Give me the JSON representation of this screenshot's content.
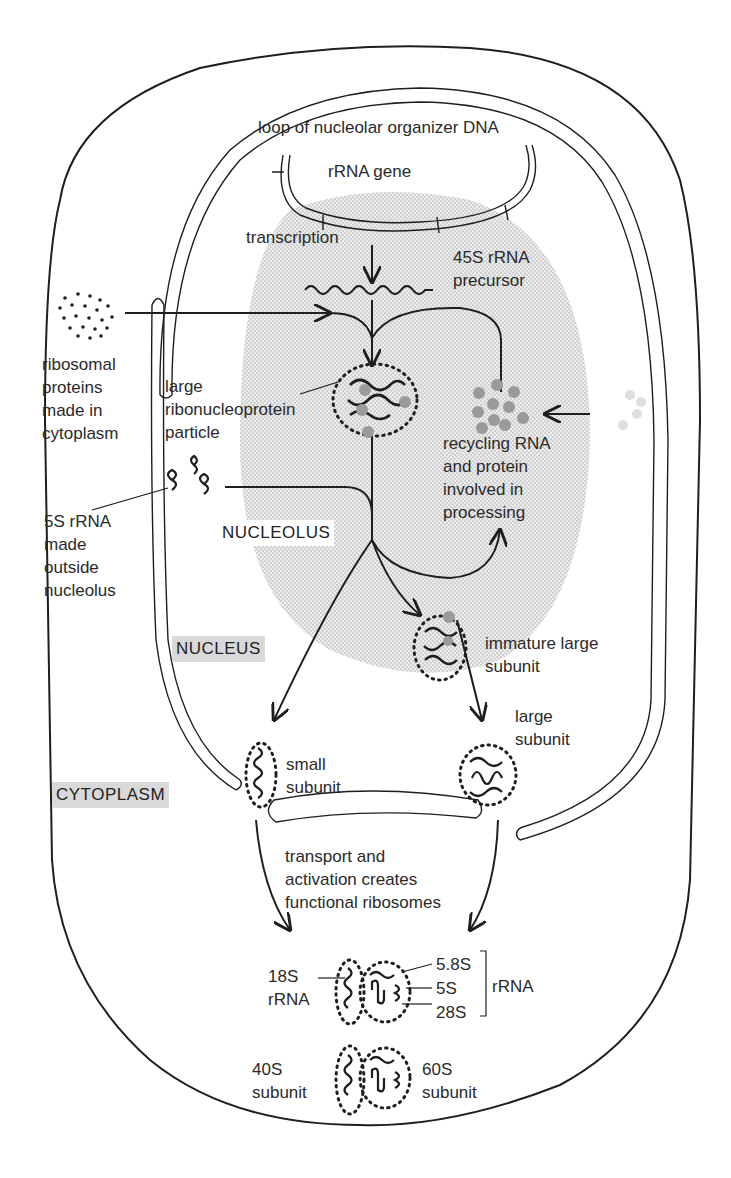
{
  "diagram": {
    "title_context": "Ribosome assembly: nucleolus to cytoplasm",
    "compartments": {
      "nucleolus": "NUCLEOLUS",
      "nucleus": "NUCLEUS",
      "cytoplasm": "CYTOPLASM"
    },
    "labels": {
      "dna_loop": "loop of nucleolar organizer DNA",
      "rrna_gene": "rRNA gene",
      "transcription": "transcription",
      "precursor_line1": "45S rRNA",
      "precursor_line2": "precursor",
      "ribosomal_proteins": "ribosomal\nproteins\nmade in\ncytoplasm",
      "large_rnp": "large\nribonucleoprotein\nparticle",
      "recycling": "recycling RNA\nand protein\ninvolved in\nprocessing",
      "five_s": "5S rRNA\nmade\noutside\nnucleolus",
      "immature_large": "immature large\nsubunit",
      "large_subunit": "large\nsubunit",
      "small_subunit": "small\nsubunit",
      "transport": "transport and\nactivation creates\nfunctional ribosomes",
      "rrna_18s": "18S\nrRNA",
      "rrna_58s": "5.8S",
      "rrna_5s": "5S",
      "rrna_28s": "28S",
      "rrna_bracket": "rRNA",
      "subunit_40s": "40S\nsubunit",
      "subunit_60s": "60S\nsubunit"
    },
    "colors": {
      "line": "#1e1e1e",
      "nucleolus_fill": "#e2e2e2",
      "protein_gray": "#9a9a9a",
      "tag_shade": "#d9d9d9"
    }
  }
}
